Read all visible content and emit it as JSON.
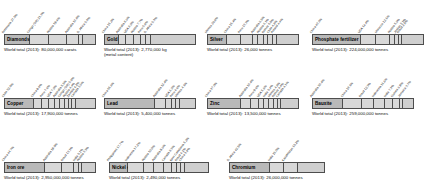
{
  "chart_data": {
    "type": "bar",
    "subtitle": "",
    "xlabel": "",
    "ylabel": "Share of world total (%)",
    "layout": "stacked 100% horizontal bars, 11 panels in 3 rows",
    "grid": false,
    "legend": "none",
    "xlim": [
      0,
      100
    ],
    "charts": [
      {
        "name": "Diamonds",
        "total_label": "World total (2013): 80,000,000 carats",
        "categories": [
          "Botswana",
          "Congo (DR)",
          "Russia",
          "Australia",
          "S. Africa",
          "Other"
        ],
        "values": [
          27.5,
          21.3,
          19.4,
          13.8,
          5.0,
          13.0
        ],
        "labels": [
          "Botswana 27.5%",
          "Congo (DR) 21.3%",
          "Russia 19.4%",
          "Australia 13.8%",
          "S. Africa 5.0%"
        ]
      },
      {
        "name": "Gold",
        "total_label": "World total (2013): 2,770,000 kg\n(metal content)",
        "categories": [
          "China",
          "Australia",
          "USA",
          "Russia",
          "Peru",
          "S. Africa",
          "Other"
        ],
        "values": [
          15.2,
          8.6,
          8.0,
          7.7,
          5.8,
          5.3,
          49.4
        ],
        "labels": [
          "China 15.2%",
          "Australia 8.6%",
          "USA 8.0%",
          "Russia 7.7%",
          "Peru 5.8%",
          "S. Africa 5.3%"
        ]
      },
      {
        "name": "Silver",
        "total_label": "World total (2013): 26,000 tonnes",
        "categories": [
          "Mexico",
          "China",
          "Peru",
          "Australia",
          "Russia",
          "Bolivia",
          "Chile",
          "Poland",
          "Other"
        ],
        "values": [
          20.8,
          15.4,
          13.3,
          6.5,
          6.1,
          5.0,
          4.8,
          4.4,
          23.7
        ],
        "labels": [
          "Mexico 20.8%",
          "China 15.4%",
          "Peru 13.3%",
          "Australia 6.5%",
          "Russia 6.1%",
          "Bolivia 5.0%",
          "Chile 4.8%",
          "Poland 4.4%"
        ]
      },
      {
        "name": "Phosphate fertilizer",
        "total_label": "World total (2013): 224,000,000 tonnes",
        "categories": [
          "China",
          "USA",
          "Morocco",
          "Russia",
          "Jordan",
          "Brazil",
          "Other"
        ],
        "values": [
          43.3,
          14.4,
          12.1,
          5.0,
          3.1,
          2.8,
          19.3
        ],
        "labels": [
          "China 43.3%",
          "USA 14.4%",
          "Morocco 12.1%",
          "Russia 5.0%",
          "Jordan 3.1%",
          "Brazil 2.8%"
        ]
      },
      {
        "name": "Copper",
        "total_label": "World total (2013): 17,900,000 tonnes",
        "categories": [
          "Chile",
          "China",
          "Peru",
          "USA",
          "Australia",
          "Congo (DR)",
          "Russia",
          "Zambia",
          "Canada",
          "Other"
        ],
        "values": [
          32.0,
          9.0,
          7.6,
          7.0,
          5.5,
          5.0,
          4.4,
          4.2,
          3.6,
          21.7
        ],
        "labels": [
          "Chile 32.0%",
          "China 9.0%",
          "Peru 7.6%",
          "USA 7.0%",
          "Australia 5.5%",
          "Congo (DR) 5.0%",
          "Russia 4.4%",
          "Zambia 4.2%",
          "Canada 3.6%"
        ]
      },
      {
        "name": "Lead",
        "total_label": "World total (2013): 5,400,000 tonnes",
        "categories": [
          "China",
          "Australia",
          "USA",
          "Peru",
          "Mexico",
          "Other"
        ],
        "values": [
          55.6,
          12.4,
          6.3,
          4.6,
          4.1,
          17.0
        ],
        "labels": [
          "China 55.6%",
          "Australia 12.4%",
          "USA 6.3%",
          "Peru 4.6%",
          "Mexico 4.1%"
        ]
      },
      {
        "name": "Zinc",
        "total_label": "World total (2013): 13,500,000 tonnes",
        "categories": [
          "China",
          "Australia",
          "Peru",
          "USA",
          "India",
          "Mexico",
          "Bolivia",
          "Canada",
          "Other"
        ],
        "values": [
          37.0,
          10.4,
          9.6,
          5.6,
          5.4,
          4.8,
          4.4,
          4.1,
          18.7
        ],
        "labels": [
          "China 37.0%",
          "Australia 10.4%",
          "Peru 9.6%",
          "USA 5.6%",
          "India 5.4%",
          "Mexico 4.8%",
          "Bolivia 4.4%",
          "Canada 4.1%"
        ]
      },
      {
        "name": "Bauxite",
        "total_label": "World total (2013): 259,000,000 tonnes",
        "categories": [
          "Australia",
          "China",
          "Brazil",
          "Indonesia",
          "India",
          "Guinea",
          "Jamaica",
          "Other"
        ],
        "values": [
          30.4,
          18.1,
          12.3,
          11.6,
          7.3,
          6.9,
          3.7,
          9.7
        ],
        "labels": [
          "Australia 30.4%",
          "China 18.1%",
          "Brazil 12.3%",
          "Indonesia 11.6%",
          "India 7.3%",
          "Guinea 6.9%",
          "Jamaica 3.7%"
        ]
      },
      {
        "name": "Iron ore",
        "total_label": "World total (2013): 2,950,000,000 tonnes",
        "categories": [
          "China",
          "Australia",
          "Brazil",
          "India",
          "Russia",
          "Other"
        ],
        "values": [
          44.7,
          19.0,
          13.1,
          5.1,
          3.5,
          14.6
        ],
        "labels": [
          "China 44.7%",
          "Australia 19.0%",
          "Brazil 13.1%",
          "India 5.1%",
          "Russia 3.5%"
        ]
      },
      {
        "name": "Nickel ore",
        "total_label": "World total (2013): 2,490,000 tonnes",
        "categories": [
          "Philippines",
          "Indonesia",
          "Russia",
          "Australia",
          "Canada",
          "New Caledonia",
          "Brazil",
          "China",
          "Other"
        ],
        "values": [
          17.7,
          17.2,
          10.0,
          9.6,
          8.3,
          5.2,
          4.1,
          3.8,
          24.1
        ],
        "labels": [
          "Philippines 17.7%",
          "Indonesia 17.2%",
          "Russia 10.0%",
          "Australia 9.6%",
          "Canada 8.3%",
          "New Caledonia 5.2%",
          "Brazil 4.1%",
          "China 3.8%"
        ]
      },
      {
        "name": "Chromium",
        "total_label": "World total (2013): 26,000,000 tonnes",
        "categories": [
          "S. Africa",
          "India",
          "Kazakhstan",
          "Other"
        ],
        "values": [
          42.5,
          15.0,
          15.2,
          27.3
        ],
        "labels": [
          "S. Africa 42.5%",
          "India 15.0%",
          "Kazakhstan 15.2%"
        ]
      }
    ]
  }
}
